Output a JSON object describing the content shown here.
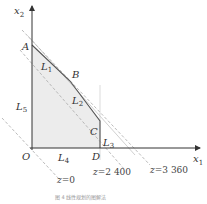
{
  "axes": {
    "x_label": "x",
    "x_sub": "1",
    "y_label": "x",
    "y_sub": "2",
    "origin": "O"
  },
  "points": {
    "A": "A",
    "B": "B",
    "C": "C",
    "D": "D"
  },
  "constraints": [
    {
      "label": "L",
      "sub": "1"
    },
    {
      "label": "L",
      "sub": "2"
    },
    {
      "label": "L",
      "sub": "3"
    },
    {
      "label": "L",
      "sub": "4"
    },
    {
      "label": "L",
      "sub": "5"
    }
  ],
  "isolines": [
    {
      "var": "z",
      "value": "=0"
    },
    {
      "var": "z",
      "value": "=2 400"
    },
    {
      "var": "z",
      "value": "=3 360"
    }
  ],
  "caption": "图 4   线性规划的图解法",
  "colors": {
    "region": "#ececec",
    "edge": "#555555",
    "dashed": "#aaaaaa"
  }
}
